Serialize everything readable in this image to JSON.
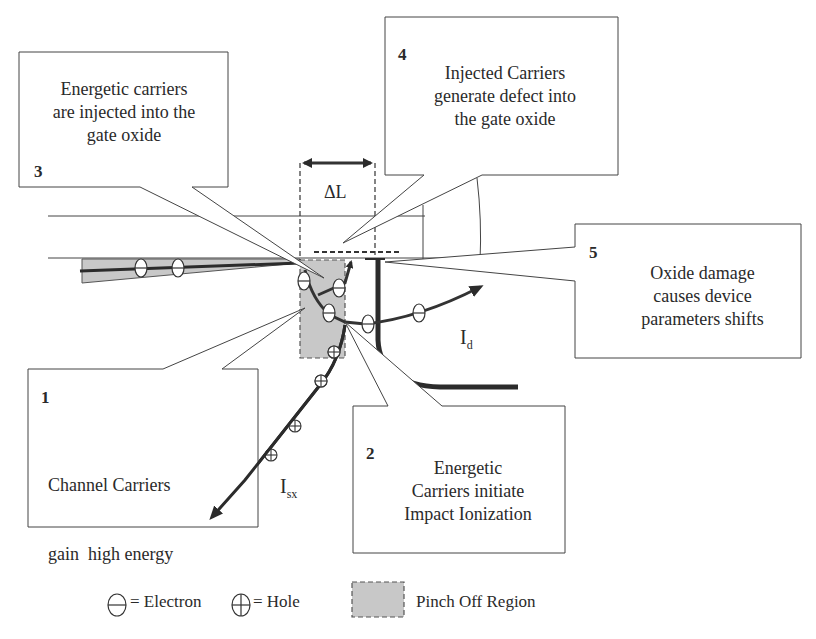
{
  "callouts": [
    {
      "number": "1",
      "text": "Channel Carriers gain  high energy",
      "lines": [
        "Channel Carriers",
        "gain  high energy"
      ]
    },
    {
      "number": "2",
      "text": "Energetic Carriers initiate Impact Ionization",
      "lines": [
        "Energetic",
        "Carriers initiate",
        "Impact Ionization"
      ]
    },
    {
      "number": "3",
      "text": "Energetic carriers are injected into the gate oxide",
      "lines": [
        "Energetic carriers",
        "are injected into the",
        "gate oxide"
      ]
    },
    {
      "number": "4",
      "text": "Injected Carriers generate defect into the gate oxide",
      "lines": [
        "Injected Carriers",
        "generate defect into",
        "the gate oxide"
      ]
    },
    {
      "number": "5",
      "text": "Oxide damage causes device parameters shifts",
      "lines": [
        "Oxide damage",
        "causes device",
        "parameters shifts"
      ]
    }
  ],
  "labels": {
    "delta_l": "ΔL",
    "drain_current": {
      "main": "I",
      "sub": "d"
    },
    "substrate_current": {
      "main": "I",
      "sub": "sx"
    }
  },
  "legend": {
    "electron": {
      "symbol": "⊖",
      "label": "= Electron"
    },
    "hole": {
      "symbol": "⊕",
      "label": "= Hole"
    },
    "pinch_off": {
      "label": "Pinch Off Region"
    }
  },
  "colors": {
    "pinch_off_fill": "#c8c8c8",
    "line": "#333333",
    "thick_line": "#2b2b2b"
  }
}
